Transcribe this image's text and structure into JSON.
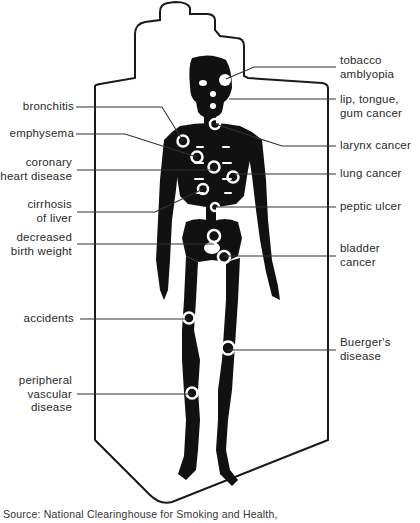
{
  "diagram": {
    "labels_left": [
      {
        "id": "bronchitis",
        "lines": [
          "bronchitis"
        ]
      },
      {
        "id": "emphysema",
        "lines": [
          "emphysema"
        ]
      },
      {
        "id": "coronary-heart-disease",
        "lines": [
          "coronary",
          "heart disease"
        ]
      },
      {
        "id": "cirrhosis-of-liver",
        "lines": [
          "cirrhosis",
          "of liver"
        ]
      },
      {
        "id": "decreased-birth-weight",
        "lines": [
          "decreased",
          "birth weight"
        ]
      },
      {
        "id": "accidents",
        "lines": [
          "accidents"
        ]
      },
      {
        "id": "peripheral-vascular-disease",
        "lines": [
          "peripheral",
          "vascular",
          "disease"
        ]
      }
    ],
    "labels_right": [
      {
        "id": "tobacco-amblyopia",
        "lines": [
          "tobacco",
          "amblyopia"
        ]
      },
      {
        "id": "lip-tongue-gum-cancer",
        "lines": [
          "lip, tongue,",
          "gum cancer"
        ]
      },
      {
        "id": "larynx-cancer",
        "lines": [
          "larynx cancer"
        ]
      },
      {
        "id": "lung-cancer",
        "lines": [
          "lung cancer"
        ]
      },
      {
        "id": "peptic-ulcer",
        "lines": [
          "peptic ulcer"
        ]
      },
      {
        "id": "bladder-cancer",
        "lines": [
          "bladder",
          "cancer"
        ]
      },
      {
        "id": "buergers-disease",
        "lines": [
          "Buerger's",
          "disease"
        ]
      }
    ],
    "source": "Source: National Clearinghouse for Smoking and Health,"
  },
  "colors": {
    "ink": "#111111",
    "line": "#333333",
    "paper": "#ffffff",
    "text": "#2a2a2a"
  }
}
